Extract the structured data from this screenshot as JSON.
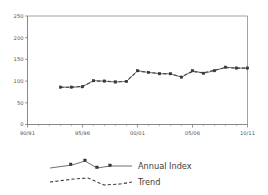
{
  "chart_data": {
    "type": "line",
    "title": "",
    "xlabel": "",
    "ylabel": "",
    "ylim": [
      0,
      250
    ],
    "xlim": [
      1990,
      2010
    ],
    "grid": false,
    "legend_position": "bottom",
    "y_ticks": [
      0,
      50,
      100,
      150,
      200,
      250
    ],
    "y_tick_labels": [
      "0",
      "50",
      "100",
      "150",
      "200",
      "250"
    ],
    "x_ticks": [
      1990,
      1995,
      2000,
      2005,
      2010
    ],
    "x_tick_labels": [
      "90/91",
      "95/96",
      "00/01",
      "05/06",
      "10/11"
    ],
    "x_minor_tick_interval": 1,
    "categories": [
      "93/94",
      "94/95",
      "95/96",
      "96/97",
      "97/98",
      "98/99",
      "99/00",
      "00/01",
      "01/02",
      "02/03",
      "03/04",
      "04/05",
      "05/06",
      "06/07",
      "07/08",
      "08/09",
      "09/10",
      "10/11"
    ],
    "series": [
      {
        "name": "Annual Index",
        "style": "solid-with-markers",
        "color": "#3a3a3a",
        "x": [
          1993,
          1994,
          1995,
          1996,
          1997,
          1998,
          1999,
          2000,
          2001,
          2002,
          2003,
          2004,
          2005,
          2006,
          2007,
          2008,
          2009,
          2010
        ],
        "values": [
          86,
          86,
          87,
          101,
          100,
          98,
          99,
          124,
          120,
          117,
          117,
          109,
          124,
          118,
          124,
          132,
          130,
          130
        ]
      },
      {
        "name": "Trend",
        "style": "dashed",
        "color": "#3d3d3d",
        "x": [
          1993,
          1994,
          1995,
          1996,
          1997,
          1998,
          1999,
          2000,
          2001,
          2002,
          2003,
          2004,
          2005,
          2006,
          2007,
          2008,
          2009,
          2010
        ],
        "values": [
          86,
          86,
          88,
          100,
          100,
          98,
          100,
          123,
          120,
          118,
          116,
          110,
          122,
          119,
          125,
          131,
          130,
          130
        ]
      }
    ]
  },
  "legend": {
    "entries": [
      {
        "label": "Annual Index",
        "marker": "square",
        "line": "solid"
      },
      {
        "label": "Trend",
        "marker": "none",
        "line": "dashed"
      }
    ]
  }
}
